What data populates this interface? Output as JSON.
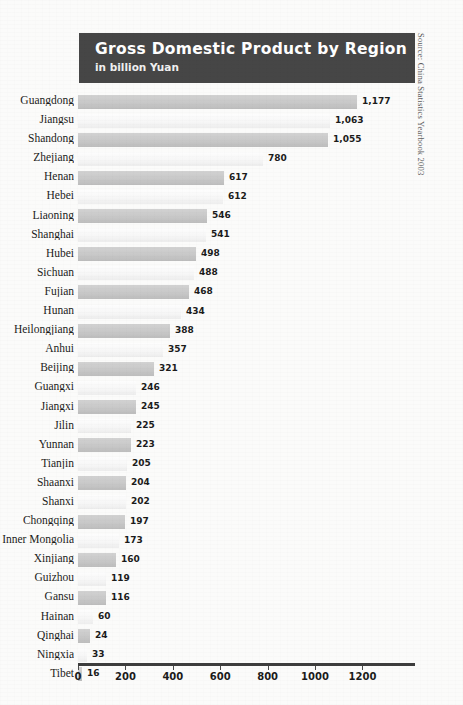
{
  "title": {
    "main": "Gross Domestic Product by Region",
    "subtitle": "in billion Yuan"
  },
  "source_note": "Source: China Statistics Yearbook 2003",
  "chart_data": {
    "type": "bar",
    "orientation": "horizontal",
    "title": "Gross Domestic Product by Region",
    "subtitle": "in billion Yuan",
    "xlabel": "",
    "ylabel": "",
    "xlim": [
      0,
      1300
    ],
    "grid": false,
    "legend": "none",
    "axis_ticks": [
      0,
      200,
      400,
      600,
      800,
      1000,
      1200
    ],
    "axis_tick_labels": [
      "0",
      "200",
      "400",
      "600",
      "800",
      "1000",
      "1200"
    ],
    "categories": [
      "Guangdong",
      "Jiangsu",
      "Shandong",
      "Zhejiang",
      "Henan",
      "Hebei",
      "Liaoning",
      "Shanghai",
      "Hubei",
      "Sichuan",
      "Fujian",
      "Hunan",
      "Heilongjiang",
      "Anhui",
      "Beijing",
      "Guangxi",
      "Jiangxi",
      "Jilin",
      "Yunnan",
      "Tianjin",
      "Shaanxi",
      "Shanxi",
      "Chongqing",
      "Inner Mongolia",
      "Xinjiang",
      "Guizhou",
      "Gansu",
      "Hainan",
      "Qinghai",
      "Ningxia",
      "Tibet"
    ],
    "values": [
      1177,
      1063,
      1055,
      780,
      617,
      612,
      546,
      541,
      498,
      488,
      468,
      434,
      388,
      357,
      321,
      246,
      245,
      225,
      223,
      205,
      204,
      202,
      197,
      173,
      160,
      119,
      116,
      60,
      24,
      33,
      16
    ],
    "value_labels": [
      "1,177",
      "1,063",
      "1,055",
      "780",
      "617",
      "612",
      "546",
      "541",
      "498",
      "488",
      "468",
      "434",
      "388",
      "357",
      "321",
      "246",
      "245",
      "225",
      "223",
      "205",
      "204",
      "202",
      "197",
      "173",
      "160",
      "119",
      "116",
      "60",
      "24",
      "33",
      "16"
    ],
    "bar_pixel_lengths": [
      279,
      252,
      250,
      185,
      146,
      145,
      129,
      128,
      118,
      116,
      111,
      103,
      92,
      85,
      76,
      58,
      58,
      53,
      53,
      49,
      48,
      48,
      47,
      41,
      38,
      28,
      28,
      15,
      12,
      9,
      4
    ]
  }
}
